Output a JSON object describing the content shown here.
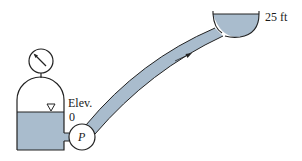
{
  "diagram": {
    "type": "pump-system",
    "colors": {
      "water": "#a9bccd",
      "stroke": "#222222",
      "background": "#ffffff"
    },
    "labels": {
      "elevation_label": "Elev.",
      "elevation_value": "0",
      "pump_label": "P",
      "reservoir_elevation": "25 ft"
    },
    "components": [
      {
        "id": "pressure-gauge",
        "description": "Pressure gauge on top of closed tank"
      },
      {
        "id": "pressurized-tank",
        "description": "Closed tank with water, free surface at Elev. 0"
      },
      {
        "id": "pump",
        "label": "P"
      },
      {
        "id": "pipe",
        "description": "Curved pipe from pump to upper reservoir, flow arrow pointing upward"
      },
      {
        "id": "upper-reservoir",
        "description": "Open bowl reservoir with surface at 25 ft"
      }
    ]
  }
}
